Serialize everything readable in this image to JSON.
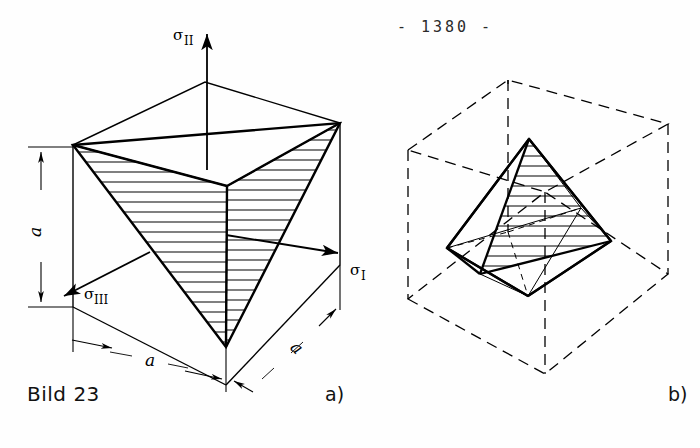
{
  "page": {
    "page_number": "- 1380 -",
    "background_color": "#fefefe",
    "ink_color": "#000000"
  },
  "caption": {
    "figure_label": "Bild 23",
    "part_a_label": "a)",
    "part_b_label": "b)"
  },
  "figure_a": {
    "name": "tetrahedron-in-cube",
    "axes": [
      {
        "id": "sigma-2",
        "symbol": "σ",
        "subscript": "II",
        "direction": "up"
      },
      {
        "id": "sigma-1",
        "symbol": "σ",
        "subscript": "I",
        "direction": "right-down"
      },
      {
        "id": "sigma-3",
        "symbol": "σ",
        "subscript": "III",
        "direction": "left-down"
      }
    ],
    "dimensions": [
      {
        "id": "height-a",
        "label": "a",
        "orientation": "vertical"
      },
      {
        "id": "width-left-a",
        "label": "a",
        "orientation": "diagonal-left"
      },
      {
        "id": "width-right-a",
        "label": "a",
        "orientation": "diagonal-right"
      }
    ],
    "shape": {
      "outer": "cube",
      "inner": "tetrahedron",
      "hatched_faces": 2,
      "line_style_outer": "solid",
      "line_style_inner": "solid"
    }
  },
  "figure_b": {
    "name": "octahedron-in-cube",
    "shape": {
      "outer": "cube",
      "inner": "octahedron",
      "hatched_faces": 1,
      "line_style_outer": "dashed",
      "line_style_inner": "solid"
    }
  }
}
